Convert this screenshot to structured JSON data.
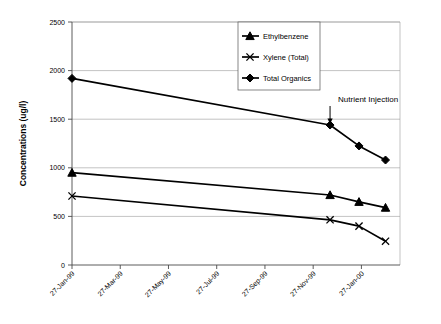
{
  "chart_data": {
    "type": "line",
    "title": "",
    "xlabel": "",
    "ylabel": "Concentrations (ug/l)",
    "ylim": [
      0,
      2500
    ],
    "yticks": [
      0,
      500,
      1000,
      1500,
      2000,
      2500
    ],
    "ytick_labels": [
      "0",
      "500",
      "1000",
      "1500",
      "2000",
      "2500"
    ],
    "grid": true,
    "legend_position": "top-center",
    "categories": [
      "27-Jan-99",
      "27-Mar-99",
      "27-May-99",
      "27-Jul-99",
      "27-Sep-99",
      "27-Nov-99",
      "27-Jan-00"
    ],
    "xtick_labels": [
      "27-Jan-99",
      "27-Mar-99",
      "27-May-99",
      "27-Jul-99",
      "27-Sep-99",
      "27-Nov-99",
      "27-Jan-00"
    ],
    "x_axis_months": [
      0,
      2,
      4,
      6,
      8,
      10,
      12
    ],
    "series": [
      {
        "name": "Ethylbenzene",
        "marker": "triangle",
        "color": "#000000",
        "points": [
          {
            "x_months": 0.0,
            "x_label": "27-Jan-99",
            "y": 950
          },
          {
            "x_months": 10.7,
            "x_label": "27-Dec-99",
            "y": 720
          },
          {
            "x_months": 11.9,
            "x_label": "27-Jan-00",
            "y": 650
          },
          {
            "x_months": 13.0,
            "x_label": "27-Feb-00",
            "y": 590
          }
        ]
      },
      {
        "name": "Xylene (Total)",
        "marker": "x",
        "color": "#000000",
        "points": [
          {
            "x_months": 0.0,
            "x_label": "27-Jan-99",
            "y": 710
          },
          {
            "x_months": 10.7,
            "x_label": "27-Dec-99",
            "y": 465
          },
          {
            "x_months": 11.9,
            "x_label": "27-Jan-00",
            "y": 400
          },
          {
            "x_months": 13.0,
            "x_label": "27-Feb-00",
            "y": 245
          }
        ]
      },
      {
        "name": "Total Organics",
        "marker": "diamond",
        "color": "#000000",
        "points": [
          {
            "x_months": 0.0,
            "x_label": "27-Jan-99",
            "y": 1920
          },
          {
            "x_months": 10.7,
            "x_label": "27-Dec-99",
            "y": 1440
          },
          {
            "x_months": 11.9,
            "x_label": "27-Jan-00",
            "y": 1225
          },
          {
            "x_months": 13.0,
            "x_label": "27-Feb-00",
            "y": 1080
          }
        ]
      }
    ],
    "annotations": [
      {
        "text": "Nutrient Injection",
        "target_x_months": 10.7,
        "target_y": 1450,
        "arrow": "down"
      }
    ]
  }
}
